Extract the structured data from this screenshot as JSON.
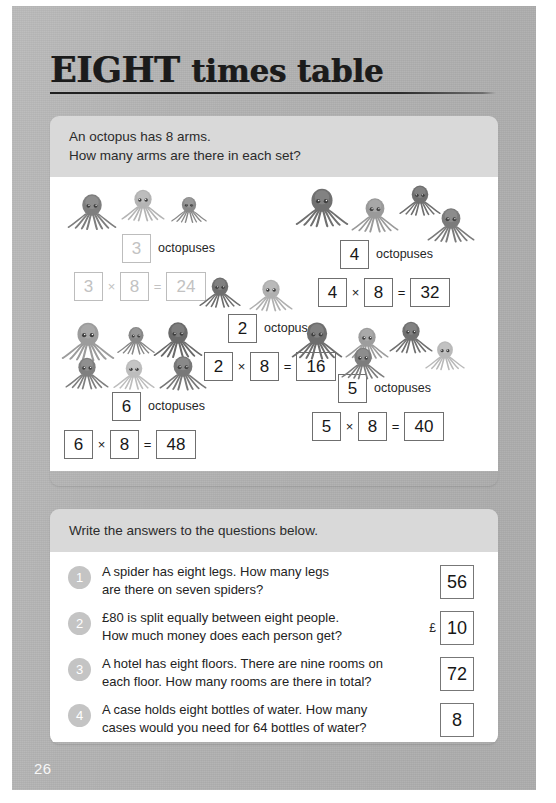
{
  "page": {
    "title_strong": "EIGHT",
    "title_rest": "times table",
    "page_number": "26"
  },
  "activity": {
    "instruction_line1": "An octopus has 8 arms.",
    "instruction_line2": "How many arms are there in each set?",
    "unit_label": "octopuses",
    "times_symbol": "×",
    "equals_symbol": "=",
    "groups": [
      {
        "id": "group-3",
        "count": "3",
        "factor": "8",
        "product": "24",
        "octopus_count": 3,
        "faded": true
      },
      {
        "id": "group-4",
        "count": "4",
        "factor": "8",
        "product": "32",
        "octopus_count": 4,
        "faded": false
      },
      {
        "id": "group-2",
        "count": "2",
        "factor": "8",
        "product": "16",
        "octopus_count": 2,
        "faded": false
      },
      {
        "id": "group-6",
        "count": "6",
        "factor": "8",
        "product": "48",
        "octopus_count": 6,
        "faded": false
      },
      {
        "id": "group-5",
        "count": "5",
        "factor": "8",
        "product": "40",
        "octopus_count": 5,
        "faded": false
      }
    ]
  },
  "questions": {
    "instruction": "Write the answers to the questions below.",
    "items": [
      {
        "number": "1",
        "line1": "A spider has eight legs.  How many legs",
        "line2": "are there on seven spiders?",
        "currency": "",
        "answer": "56"
      },
      {
        "number": "2",
        "line1": "£80 is split equally between eight people.",
        "line2": "How much money does each person get?",
        "currency": "£",
        "answer": "10"
      },
      {
        "number": "3",
        "line1": "A hotel has eight floors.  There are nine rooms on",
        "line2": "each floor.  How many rooms are there in total?",
        "currency": "",
        "answer": "72"
      },
      {
        "number": "4",
        "line1": "A case holds eight bottles of water.  How many",
        "line2": "cases would you need for 64 bottles of water?",
        "currency": "",
        "answer": "8"
      }
    ]
  },
  "colors": {
    "page_grey": "#b2b2b2",
    "panel_head_grey": "#d9d9d9",
    "panel_body_white": "#ffffff",
    "octopus_grey": "#8c8c8c",
    "box_border": "#6f6f6f",
    "faded_grey": "#c2c2c2"
  }
}
